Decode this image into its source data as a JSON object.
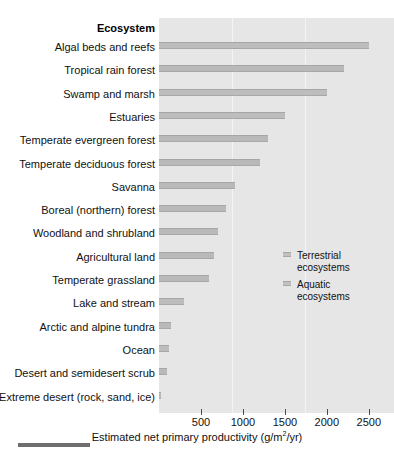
{
  "chart_data": {
    "type": "bar",
    "orientation": "horizontal",
    "title": "",
    "ylabel": "Ecosystem",
    "xlabel": "Estimated net primary productivity (g/m2/yr)",
    "xlabel_prefix": "Estimated net primary productivity (g/m",
    "xlabel_exponent": "2",
    "xlabel_suffix": "/yr)",
    "xlim": [
      0,
      2800
    ],
    "xticks": [
      500,
      1000,
      1500,
      2000,
      2500
    ],
    "xtick_labels": [
      "500",
      "1000",
      "1500",
      "2000",
      "2500"
    ],
    "gridlines": [
      1000,
      2000
    ],
    "grid": true,
    "legend_position": "center-right",
    "categories": [
      "Algal beds and reefs",
      "Tropical rain forest",
      "Swamp and marsh",
      "Estuaries",
      "Temperate evergreen forest",
      "Temperate deciduous forest",
      "Savanna",
      "Boreal (northern) forest",
      "Woodland and shrubland",
      "Agricultural land",
      "Temperate grassland",
      "Lake and stream",
      "Arctic and alpine tundra",
      "Ocean",
      "Desert and semidesert scrub",
      "Extreme desert (rock, sand, ice)"
    ],
    "values": [
      2500,
      2200,
      2000,
      1500,
      1300,
      1200,
      900,
      800,
      700,
      650,
      600,
      300,
      140,
      125,
      90,
      3
    ],
    "groups": [
      "Aquatic ecosystems",
      "Terrestrial ecosystems",
      "Aquatic ecosystems",
      "Aquatic ecosystems",
      "Terrestrial ecosystems",
      "Terrestrial ecosystems",
      "Terrestrial ecosystems",
      "Terrestrial ecosystems",
      "Terrestrial ecosystems",
      "Terrestrial ecosystems",
      "Terrestrial ecosystems",
      "Aquatic ecosystems",
      "Terrestrial ecosystems",
      "Aquatic ecosystems",
      "Terrestrial ecosystems",
      "Terrestrial ecosystems"
    ],
    "legend": [
      {
        "label_line1": "Terrestrial",
        "label_line2": "ecosystems",
        "color": "#c0c0c0"
      },
      {
        "label_line1": "Aquatic",
        "label_line2": "ecosystems",
        "color": "#c0c0c0"
      }
    ],
    "colors": {
      "plot_background": "#e6e6e6",
      "bar": "#b9b9b9",
      "gridline": "#f4f4f4",
      "text": "#111111",
      "footer_rule": "#6e6e6e"
    }
  }
}
